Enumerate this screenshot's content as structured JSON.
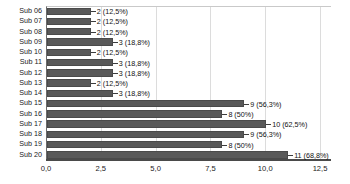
{
  "chart_data": {
    "type": "bar",
    "orientation": "horizontal",
    "title": "",
    "xlabel": "",
    "ylabel": "",
    "xlim": [
      0,
      13.0
    ],
    "xticks": [
      "0,0",
      "2,5",
      "5,0",
      "7,5",
      "10,0",
      "12,5"
    ],
    "xtick_values": [
      0,
      2.5,
      5.0,
      7.5,
      10.0,
      12.5
    ],
    "grid": true,
    "legend": false,
    "bar_color": "#595959",
    "categories": [
      "Sub 06",
      "Sub 07",
      "Sub 08",
      "Sub 09",
      "Sub 10",
      "Sub 11",
      "Sub 12",
      "Sub 13",
      "Sub 14",
      "Sub 15",
      "Sub 16",
      "Sub 17",
      "Sub 18",
      "Sub 19",
      "Sub 20"
    ],
    "values": [
      2,
      2,
      2,
      3,
      2,
      3,
      3,
      2,
      3,
      9,
      8,
      10,
      9,
      8,
      11
    ],
    "data_labels": [
      "2 (12,5%)",
      "2 (12,5%)",
      "2 (12,5%)",
      "3 (18,8%)",
      "2 (12,5%)",
      "3 (18,8%)",
      "3 (18,8%)",
      "2 (12,5%)",
      "3 (18,8%)",
      "9 (56,3%)",
      "8 (50%)",
      "10 (62,5%)",
      "9 (56,3%)",
      "8 (50%)",
      "11 (68,8%)"
    ],
    "percentages": [
      12.5,
      12.5,
      12.5,
      18.8,
      12.5,
      18.8,
      18.8,
      12.5,
      18.8,
      56.3,
      50,
      62.5,
      56.3,
      50,
      68.8
    ]
  }
}
